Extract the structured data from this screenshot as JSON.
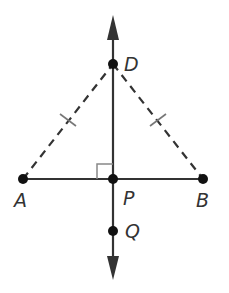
{
  "diagram": {
    "type": "geometry",
    "colors": {
      "line": "#333333",
      "point": "#111111",
      "tick": "#777777",
      "right_angle": "#888888",
      "background": "#ffffff"
    },
    "points": {
      "A": {
        "label": "A",
        "x": 23,
        "y": 179
      },
      "B": {
        "label": "B",
        "x": 203,
        "y": 179
      },
      "P": {
        "label": "P",
        "x": 113,
        "y": 179
      },
      "D": {
        "label": "D",
        "x": 113,
        "y": 64
      },
      "Q": {
        "label": "Q",
        "x": 113,
        "y": 231
      }
    },
    "segments": [
      {
        "from": "A",
        "to": "B",
        "style": "solid"
      },
      {
        "from": "A",
        "to": "D",
        "style": "dashed",
        "congruence_mark": 1
      },
      {
        "from": "D",
        "to": "B",
        "style": "dashed",
        "congruence_mark": 1
      }
    ],
    "lines": [
      {
        "through": [
          "D",
          "P",
          "Q"
        ],
        "style": "solid",
        "arrows": "both",
        "orientation": "vertical"
      }
    ],
    "right_angle": {
      "at": "P",
      "between": [
        "PA",
        "PD"
      ]
    }
  }
}
